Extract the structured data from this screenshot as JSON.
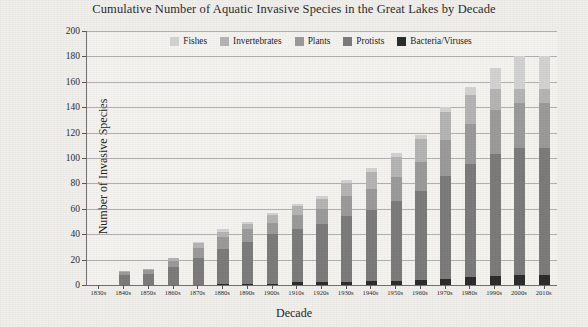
{
  "chart_data": {
    "type": "bar",
    "subtype": "stacked-bar",
    "title": "Cumulative Number of Aquatic Invasive Species in the Great Lakes by Decade",
    "xlabel": "Decade",
    "ylabel": "Number of Invasive Species",
    "ylim": [
      0,
      200
    ],
    "ytick_step": 20,
    "yticks": [
      0,
      20,
      40,
      60,
      80,
      100,
      120,
      140,
      160,
      180,
      200
    ],
    "grid": true,
    "legend_position": "top-center",
    "categories": [
      "1830s",
      "1840s",
      "1850s",
      "1860s",
      "1870s",
      "1880s",
      "1890s",
      "1900s",
      "1910s",
      "1920s",
      "1930s",
      "1940s",
      "1950s",
      "1960s",
      "1970s",
      "1980s",
      "1990s",
      "2000s",
      "2010s"
    ],
    "series": [
      {
        "name": "Bacteria/Viruses",
        "color": "#2b2b2b",
        "values": [
          0,
          0,
          0,
          0,
          0,
          1,
          1,
          1,
          2,
          2,
          2,
          3,
          3,
          4,
          5,
          6,
          7,
          8,
          8
        ]
      },
      {
        "name": "Protists",
        "color": "#7a7a7a",
        "values": [
          0,
          8,
          9,
          14,
          22,
          28,
          34,
          40,
          44,
          48,
          54,
          59,
          66,
          74,
          86,
          95,
          103,
          108,
          108
        ]
      },
      {
        "name": "Plants",
        "color": "#9a9a9a",
        "values": [
          0,
          10,
          12,
          19,
          30,
          38,
          44,
          49,
          55,
          60,
          70,
          76,
          85,
          97,
          114,
          127,
          138,
          143,
          143
        ]
      },
      {
        "name": "Invertebrates",
        "color": "#b4b4b4",
        "values": [
          0,
          11,
          13,
          21,
          34,
          42,
          48,
          55,
          62,
          68,
          80,
          89,
          101,
          115,
          136,
          150,
          154,
          154,
          154
        ]
      },
      {
        "name": "Fishes",
        "color": "#d2d2d2",
        "values": [
          0,
          11,
          13,
          21,
          35,
          44,
          50,
          57,
          64,
          70,
          83,
          92,
          104,
          118,
          140,
          156,
          171,
          180,
          180
        ]
      }
    ],
    "segment_values": {
      "note": "per-decade segment heights (not cumulative across series)",
      "Fishes": [
        0,
        0,
        0,
        0,
        1,
        2,
        2,
        2,
        2,
        2,
        3,
        3,
        3,
        3,
        4,
        6,
        17,
        26,
        26
      ],
      "Invertebrates": [
        0,
        1,
        1,
        2,
        4,
        4,
        4,
        6,
        7,
        8,
        10,
        13,
        16,
        18,
        22,
        23,
        16,
        11,
        11
      ],
      "Plants": [
        0,
        2,
        3,
        5,
        8,
        10,
        10,
        9,
        11,
        12,
        16,
        17,
        19,
        23,
        28,
        32,
        35,
        35,
        35
      ],
      "Protists": [
        0,
        8,
        9,
        14,
        21,
        27,
        33,
        39,
        42,
        46,
        52,
        56,
        63,
        70,
        81,
        89,
        96,
        100,
        100
      ],
      "Bacteria/Viruses": [
        0,
        0,
        0,
        0,
        0,
        1,
        1,
        1,
        2,
        2,
        2,
        3,
        3,
        4,
        5,
        6,
        7,
        8,
        8
      ]
    },
    "totals": [
      0,
      11,
      13,
      21,
      35,
      44,
      50,
      57,
      64,
      70,
      83,
      92,
      104,
      118,
      140,
      156,
      171,
      180,
      180
    ]
  },
  "legend": {
    "items": [
      {
        "label": "Fishes",
        "color": "#d2d2d2"
      },
      {
        "label": "Invertebrates",
        "color": "#b4b4b4"
      },
      {
        "label": "Plants",
        "color": "#9a9a9a"
      },
      {
        "label": "Protists",
        "color": "#7a7a7a"
      },
      {
        "label": "Bacteria/Viruses",
        "color": "#2b2b2b"
      }
    ]
  },
  "theme": {
    "page_background": "#f0efec",
    "plot_background": "#f4f3f0",
    "axis_color": "#6f6f6f",
    "grid_color": "#9a9a9a",
    "text_color": "#1a1a1a"
  }
}
